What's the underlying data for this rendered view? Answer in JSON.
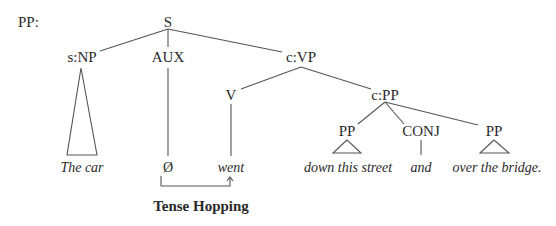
{
  "diagram": {
    "prefix_label": "PP:",
    "caption": "Tense Hopping",
    "nodes": {
      "S": "S",
      "subject_np": "s:NP",
      "aux": "AUX",
      "complement_vp": "c:VP",
      "verb": "V",
      "complement_pp": "c:PP",
      "pp_left": "PP",
      "conj": "CONJ",
      "pp_right": "PP"
    },
    "leaves": {
      "subject": "The car",
      "aux_null": "Ø",
      "verb": "went",
      "pp_left": "down this street",
      "conj": "and",
      "pp_right": "over the bridge."
    },
    "colors": {
      "text": "#2a2a2a",
      "lines": "#555555",
      "background": "#ffffff"
    }
  }
}
